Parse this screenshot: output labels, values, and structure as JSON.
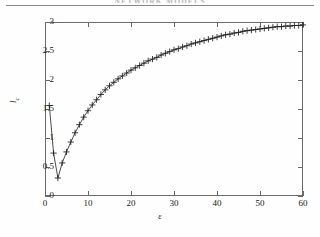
{
  "page": {
    "header_text": "NETWORK MODELS",
    "background": "#fefefe",
    "rule_color": "#8a8a8a"
  },
  "chart_data": {
    "type": "line",
    "title": "",
    "subtitle": "",
    "xlabel": "ε",
    "ylabel": "l",
    "ylabel_sub": "c",
    "xlim": [
      0,
      60
    ],
    "ylim": [
      0,
      3
    ],
    "xticks": [
      0,
      10,
      20,
      30,
      40,
      50,
      60
    ],
    "yticks": [
      0,
      0.5,
      1,
      1.5,
      2,
      2.5,
      3
    ],
    "xtick_labels": [
      "0",
      "10",
      "20",
      "30",
      "40",
      "50",
      "60"
    ],
    "ytick_labels": [
      "0",
      "0.5",
      "1",
      "1.5",
      "2",
      "2.5",
      "3"
    ],
    "grid": false,
    "legend": false,
    "marker": "+",
    "marker_color": "#202020",
    "line_color": "#202020",
    "line_width": 0.8,
    "series": [
      {
        "name": "l_c vs epsilon",
        "x": [
          1,
          2,
          3,
          4,
          5,
          6,
          7,
          8,
          9,
          10,
          11,
          12,
          13,
          14,
          15,
          16,
          17,
          18,
          19,
          20,
          21,
          22,
          23,
          24,
          25,
          26,
          27,
          28,
          29,
          30,
          31,
          32,
          33,
          34,
          35,
          36,
          37,
          38,
          39,
          40,
          41,
          42,
          43,
          44,
          45,
          46,
          47,
          48,
          49,
          50,
          51,
          52,
          53,
          54,
          55,
          56,
          57,
          58,
          59,
          60
        ],
        "values": [
          1.56,
          0.74,
          0.31,
          0.57,
          0.76,
          0.93,
          1.09,
          1.23,
          1.36,
          1.47,
          1.57,
          1.66,
          1.75,
          1.83,
          1.9,
          1.96,
          2.02,
          2.07,
          2.12,
          2.17,
          2.21,
          2.25,
          2.29,
          2.33,
          2.36,
          2.39,
          2.43,
          2.46,
          2.49,
          2.52,
          2.54,
          2.57,
          2.59,
          2.62,
          2.64,
          2.66,
          2.68,
          2.7,
          2.72,
          2.74,
          2.76,
          2.78,
          2.79,
          2.81,
          2.82,
          2.84,
          2.85,
          2.86,
          2.87,
          2.88,
          2.89,
          2.9,
          2.91,
          2.92,
          2.92,
          2.93,
          2.93,
          2.94,
          2.94,
          2.95
        ]
      }
    ],
    "annotations": []
  }
}
